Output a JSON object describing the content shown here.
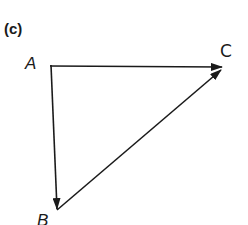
{
  "figure": {
    "panel_label": "(c)",
    "points": {
      "A": {
        "label": "A",
        "x": 51,
        "y": 66
      },
      "B": {
        "label": "B",
        "x": 57,
        "y": 209
      },
      "C": {
        "label": "C",
        "x": 222,
        "y": 67
      }
    },
    "vectors": [
      {
        "from": "A",
        "to": "C",
        "name": "vector-ac"
      },
      {
        "from": "A",
        "to": "B",
        "name": "vector-ab"
      },
      {
        "from": "B",
        "to": "C",
        "name": "vector-bc"
      }
    ],
    "stroke_color": "#1a1a1a"
  }
}
